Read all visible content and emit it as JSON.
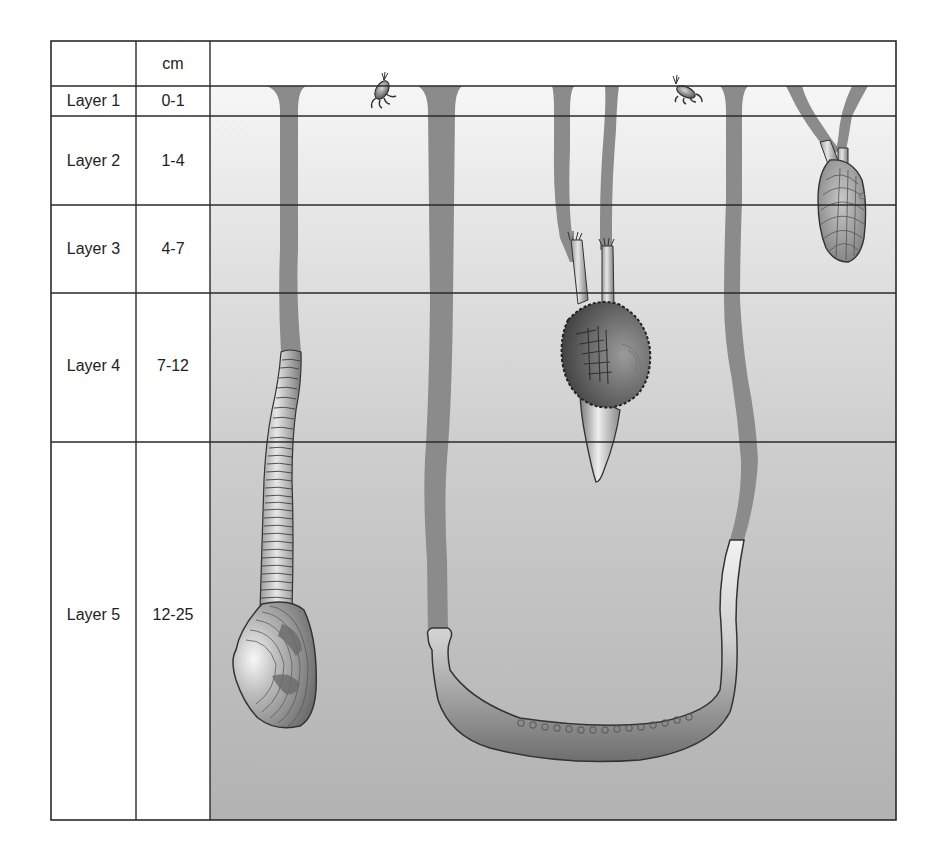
{
  "table": {
    "header": {
      "layer_col": "",
      "depth_col": "cm"
    },
    "rows": [
      {
        "layer": "Layer 1",
        "depth": "0-1"
      },
      {
        "layer": "Layer 2",
        "depth": "1-4"
      },
      {
        "layer": "Layer 3",
        "depth": "4-7"
      },
      {
        "layer": "Layer 4",
        "depth": "7-12"
      },
      {
        "layer": "Layer 5",
        "depth": "12-25"
      }
    ]
  },
  "organisms": [
    {
      "name": "amphipod-crustacean",
      "layer": "Layer 1",
      "position": "surface, left"
    },
    {
      "name": "amphipod-crustacean",
      "layer": "Layer 1",
      "position": "surface, right"
    },
    {
      "name": "deep-burrowing-clam-with-long-siphon",
      "layer": "Layer 4-5",
      "position": "left"
    },
    {
      "name": "u-shaped-burrowing-worm",
      "layer": "Layer 5",
      "position": "center"
    },
    {
      "name": "cockle-bivalve-with-short-siphons",
      "layer": "Layer 3-4",
      "position": "center-right"
    },
    {
      "name": "small-bivalve-with-paired-siphons",
      "layer": "Layer 2-3",
      "position": "right"
    }
  ],
  "colors": {
    "frame": "#2a2a2a",
    "sediment_top": "#f4f4f4",
    "sediment_bottom": "#b4b4b4",
    "burrow": "#8a8a8a",
    "shell_dark": "#5a5a5a",
    "shell_light": "#d8d8d8"
  }
}
